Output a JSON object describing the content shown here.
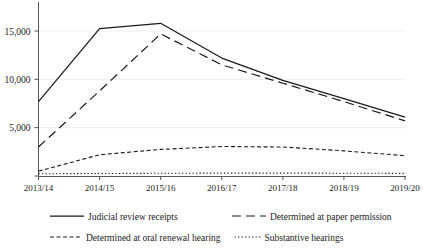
{
  "chart_data": {
    "type": "line",
    "title": "",
    "subtitle": "",
    "xlabel": "",
    "ylabel": "",
    "grid": false,
    "legend_position": "bottom",
    "categories": [
      "2013/14",
      "2014/15",
      "2015/16",
      "2016/17",
      "2017/18",
      "2018/19",
      "2019/20"
    ],
    "x_tick_labels": [
      "2013/14",
      "2014/15",
      "2015/16",
      "2016/17",
      "2017/18",
      "2018/19",
      "2019/20"
    ],
    "y_tick_labels": [
      "5,000",
      "10,000",
      "15,000"
    ],
    "y_tick_values": [
      5000,
      10000,
      15000
    ],
    "ylim": [
      0,
      16500
    ],
    "series": [
      {
        "name": "Judicial review receipts",
        "style": "solid",
        "color": "#1a1a1a",
        "values": [
          7700,
          15250,
          15800,
          12200,
          9900,
          8000,
          6100
        ]
      },
      {
        "name": "Determined at paper permission",
        "style": "dashed",
        "color": "#1a1a1a",
        "values": [
          3000,
          8800,
          14700,
          11500,
          9600,
          7700,
          5700
        ]
      },
      {
        "name": "Determined at oral renewal hearing",
        "style": "short-dashed",
        "color": "#1a1a1a",
        "values": [
          500,
          2200,
          2750,
          3050,
          3000,
          2600,
          2100
        ]
      },
      {
        "name": "Substantive hearings",
        "style": "dotted",
        "color": "#1a1a1a",
        "values": [
          230,
          260,
          280,
          300,
          300,
          290,
          270
        ]
      }
    ],
    "legend": [
      {
        "label": "Judicial review receipts",
        "style": "solid"
      },
      {
        "label": "Determined at paper permission",
        "style": "dashed"
      },
      {
        "label": "Determined at oral renewal hearing",
        "style": "short-dashed"
      },
      {
        "label": "Substantive hearings",
        "style": "dotted"
      }
    ]
  }
}
